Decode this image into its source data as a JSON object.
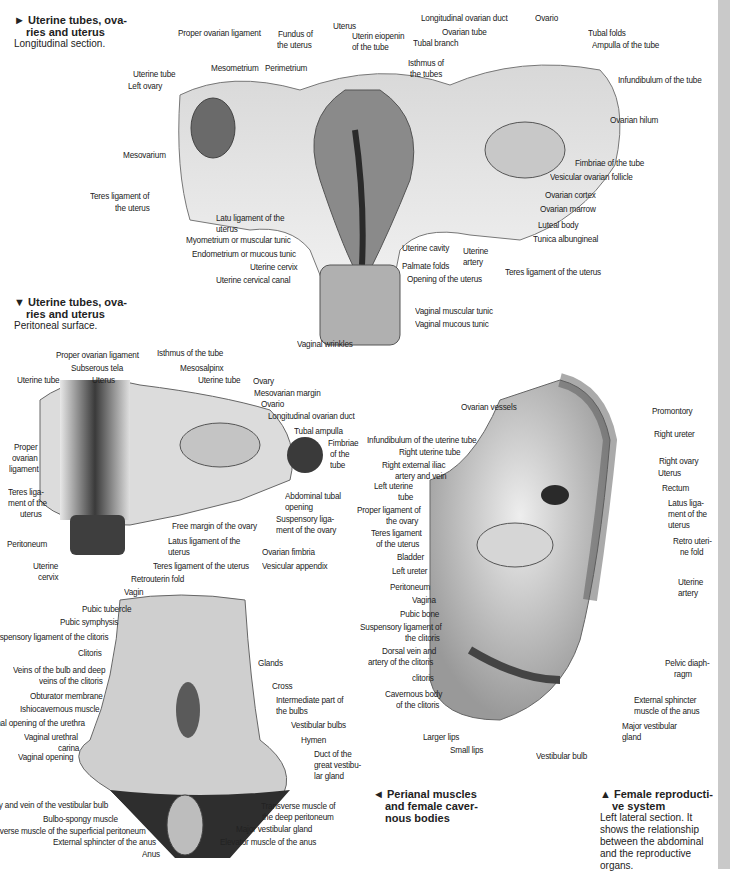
{
  "captions": {
    "fig1": {
      "arrow": "►",
      "title_l1": "Uterine tubes, ova-",
      "title_l2": "ries and uterus",
      "desc": "Longitudinal section."
    },
    "fig2": {
      "arrow": "▼",
      "title_l1": "Uterine tubes, ova-",
      "title_l2": "ries and uterus",
      "desc": "Peritoneal surface."
    },
    "fig3": {
      "arrow": "◄",
      "title_l1": "Perianal muscles",
      "title_l2": "and female caver-",
      "title_l3": "nous bodies"
    },
    "fig4": {
      "arrow": "▲",
      "title_l1": "Female reproducti-",
      "title_l2": "ve system",
      "desc_l1": "Left lateral section. It",
      "desc_l2": "shows the relationship",
      "desc_l3": "between the abdominal",
      "desc_l4": "and the reproductive",
      "desc_l5": "organs."
    }
  },
  "fig1_labels": [
    "Proper ovarian ligament",
    "Fundus of",
    "the uterus",
    "Uterus",
    "Uterin eiopenin",
    "of the tube",
    "Longitudinal ovarian duct",
    "Ovarian tube",
    "Tubal branch",
    "Ovario",
    "Tubal folds",
    "Ampulla of the tube",
    "Uterine tube",
    "Left ovary",
    "Mesometrium",
    "Perimetrium",
    "Isthmus of",
    "the tubes",
    "Infundibulum of the tube",
    "Ovarian hilum",
    "Mesovarium",
    "Fimbriae of the tube",
    "Vesicular ovarian follicle",
    "Ovarian cortex",
    "Ovarian marrow",
    "Teres ligament of",
    "the uterus",
    "Latu ligament of the",
    "uterus",
    "Luteal body",
    "Myometrium or muscular tunic",
    "Tunica albungineal",
    "Endometrium or mucous tunic",
    "Uterine cavity",
    "Uterine",
    "artery",
    "Palmate folds",
    "Uterine cervix",
    "Teres ligament of the uterus",
    "Uterine cervical canal",
    "Opening of the uterus",
    "Vaginal muscular tunic",
    "Vaginal mucous tunic",
    "Vaginal wrinkles"
  ],
  "fig2_labels": [
    "Proper ovarian ligament",
    "Isthmus of the tube",
    "Subserous tela",
    "Mesosalpinx",
    "Uterine tube",
    "Uterus",
    "Uterine tube",
    "Ovary",
    "Mesovarian margin",
    "Ovario",
    "Longitudinal ovarian duct",
    "Tubal ampulla",
    "Fimbriae",
    "of the",
    "tube",
    "Proper",
    "ovarian",
    "ligament",
    "Teres liga-",
    "ment of the",
    "uterus",
    "Abdominal tubal",
    "opening",
    "Suspensory liga-",
    "ment of the ovary",
    "Free margin of the ovary",
    "Peritoneum",
    "Latus ligament of the",
    "uterus",
    "Ovarian fimbria",
    "Uterine",
    "cervix",
    "Teres ligament of the uterus",
    "Vesicular appendix",
    "Retrouterin fold",
    "Vagin"
  ],
  "fig3_labels": [
    "Pubic tubercle",
    "Pubic symphysis",
    "Suspensory ligament of the clitoris",
    "Clitoris",
    "Glands",
    "Veins of the bulb and deep",
    "veins of the clitoris",
    "Cross",
    "Obturator membrane",
    "Intermediate part of",
    "the bulbs",
    "Ishiocavernous muscle",
    "Vestibular bulbs",
    "External opening of the urethra",
    "Hymen",
    "Vaginal urethral",
    "carina",
    "Duct of the",
    "great vestibu-",
    "lar gland",
    "Vaginal opening",
    "Artery and vein of the vestibular bulb",
    "Transverse muscle of",
    "the deep peritoneum",
    "Bulbo-spongy muscle",
    "Major vestibular gland",
    "Transverse muscle of the superficial peritoneum",
    "External sphincter of the anus",
    "Elevator muscle of the anus",
    "Anus"
  ],
  "fig4_labels": [
    "Ovarian vessels",
    "Promontory",
    "Right ureter",
    "Infundibulum of the uterine tube",
    "Right uterine tube",
    "Right ovary",
    "Right external iliac",
    "artery and vein",
    "Uterus",
    "Left uterine",
    "tube",
    "Rectum",
    "Proper ligament of",
    "the ovary",
    "Latus liga-",
    "ment of the",
    "uterus",
    "Teres ligament",
    "of the uterus",
    "Retro uteri-",
    "ne fold",
    "Bladder",
    "Left ureter",
    "Uterine",
    "artery",
    "Peritoneum",
    "Vagina",
    "Pubic bone",
    "Suspensory ligament of",
    "the clitoris",
    "Dorsal vein and",
    "artery of the clitoris",
    "Pelvic diaph-",
    "ragm",
    "clitoris",
    "Cavernous body",
    "of the clitoris",
    "External sphincter",
    "muscle of the anus",
    "Major vestibular",
    "gland",
    "Larger lips",
    "Small lips",
    "Vestibular bulb"
  ],
  "colors": {
    "strip": "#c9c9c9",
    "text": "#222222",
    "tissue_light": "#e6e6e6",
    "tissue_mid": "#b5b5b5",
    "tissue_dark": "#4a4a4a"
  }
}
